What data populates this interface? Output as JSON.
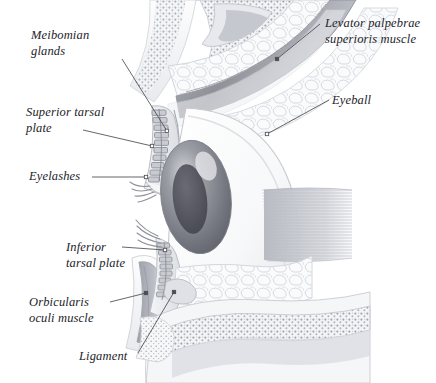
{
  "figure": {
    "background_color": "#ffffff",
    "ink_color": "#22232a",
    "leader_color": "#4a4a52",
    "labels": [
      {
        "id": "meibomian-glands",
        "text": "Meibomian\nglands",
        "side": "left"
      },
      {
        "id": "superior-tarsal-plate",
        "text": "Superior tarsal\nplate",
        "side": "left"
      },
      {
        "id": "eyelashes",
        "text": "Eyelashes",
        "side": "left"
      },
      {
        "id": "levator-palpebrae",
        "text": "Levator palpebrae\nsuperioris muscle",
        "side": "right"
      },
      {
        "id": "eyeball",
        "text": "Eyeball",
        "side": "right"
      },
      {
        "id": "inferior-tarsal-plate",
        "text": "Inferior\ntarsal plate",
        "side": "left"
      },
      {
        "id": "orbicularis-oculi",
        "text": "Orbicularis\noculi muscle",
        "side": "left"
      },
      {
        "id": "ligament",
        "text": "Ligament",
        "side": "left"
      }
    ],
    "structures": [
      {
        "id": "eyeball-sclera",
        "name": "Eyeball (sclera)",
        "color": "#fbfbfc"
      },
      {
        "id": "cornea-iris",
        "name": "Iris and cornea",
        "color": "#8d8f97"
      },
      {
        "id": "pupil",
        "name": "Pupil",
        "color": "#5c5d66"
      },
      {
        "id": "superior-tarsal-plate",
        "name": "Superior tarsal plate",
        "color": "#e9eaee"
      },
      {
        "id": "inferior-tarsal-plate",
        "name": "Inferior tarsal plate",
        "color": "#e9eaee"
      },
      {
        "id": "meibomian-glands",
        "name": "Meibomian gland acini",
        "color": "#b9bcc4"
      },
      {
        "id": "levator-muscle",
        "name": "Levator palpebrae superioris muscle",
        "color": "#a8abb4"
      },
      {
        "id": "orbicularis-muscle",
        "name": "Orbicularis oculi muscle",
        "color": "#b6b9c1"
      },
      {
        "id": "rectus-muscle",
        "name": "Extraocular rectus muscle",
        "color": "#c9ccd3"
      },
      {
        "id": "orbital-fat",
        "name": "Orbital fat lobules",
        "color": "#f2f3f5"
      },
      {
        "id": "orbital-bone",
        "name": "Orbital bone with marrow",
        "color": "#eceef1"
      },
      {
        "id": "eyelashes",
        "name": "Eyelashes (cilia)",
        "color": "#9a9ca4"
      },
      {
        "id": "ligament",
        "name": "Ligament",
        "color": "#d6d8dd"
      }
    ]
  }
}
